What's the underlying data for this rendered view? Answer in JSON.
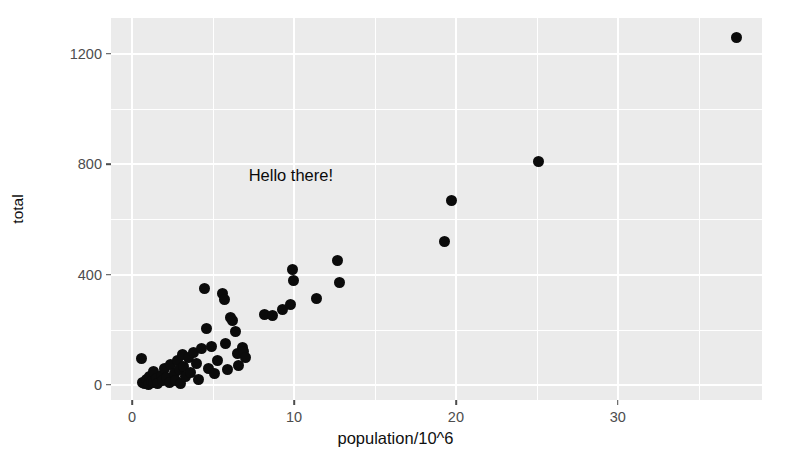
{
  "chart_data": {
    "type": "scatter",
    "title": "",
    "xlabel": "population/10^6",
    "ylabel": "total",
    "xlim": [
      -1.3,
      38.9
    ],
    "ylim": [
      -55,
      1330
    ],
    "x_ticks": [
      0,
      10,
      20,
      30
    ],
    "y_ticks": [
      0,
      400,
      800,
      1200
    ],
    "x_minor_ticks": [
      5,
      15,
      25,
      35
    ],
    "y_minor_ticks": [
      200,
      600,
      1000
    ],
    "grid": true,
    "legend": "none",
    "point_color": "#0b0b0b",
    "panel_background": "#ebebeb",
    "grid_color": "#ffffff",
    "annotations": [
      {
        "text": "Hello there!",
        "x": 7.2,
        "y": 790
      }
    ],
    "series": [
      {
        "name": "states",
        "points": [
          {
            "x": 0.6,
            "y": 95
          },
          {
            "x": 0.65,
            "y": 10
          },
          {
            "x": 0.75,
            "y": 5
          },
          {
            "x": 0.9,
            "y": 18
          },
          {
            "x": 1.0,
            "y": 2
          },
          {
            "x": 1.1,
            "y": 30
          },
          {
            "x": 1.2,
            "y": 12
          },
          {
            "x": 1.3,
            "y": 48
          },
          {
            "x": 1.35,
            "y": 8
          },
          {
            "x": 1.5,
            "y": 22
          },
          {
            "x": 1.6,
            "y": 6
          },
          {
            "x": 1.8,
            "y": 35
          },
          {
            "x": 1.9,
            "y": 14
          },
          {
            "x": 2.0,
            "y": 60
          },
          {
            "x": 2.1,
            "y": 25
          },
          {
            "x": 2.3,
            "y": 8
          },
          {
            "x": 2.4,
            "y": 72
          },
          {
            "x": 2.6,
            "y": 40
          },
          {
            "x": 2.7,
            "y": 16
          },
          {
            "x": 2.8,
            "y": 88
          },
          {
            "x": 2.9,
            "y": 55
          },
          {
            "x": 3.0,
            "y": 5
          },
          {
            "x": 3.1,
            "y": 110
          },
          {
            "x": 3.2,
            "y": 65
          },
          {
            "x": 3.3,
            "y": 30
          },
          {
            "x": 3.5,
            "y": 100
          },
          {
            "x": 3.6,
            "y": 45
          },
          {
            "x": 3.8,
            "y": 118
          },
          {
            "x": 4.0,
            "y": 78
          },
          {
            "x": 4.1,
            "y": 20
          },
          {
            "x": 4.3,
            "y": 130
          },
          {
            "x": 4.5,
            "y": 350
          },
          {
            "x": 4.6,
            "y": 205
          },
          {
            "x": 4.7,
            "y": 60
          },
          {
            "x": 4.9,
            "y": 140
          },
          {
            "x": 5.1,
            "y": 42
          },
          {
            "x": 5.3,
            "y": 90
          },
          {
            "x": 5.6,
            "y": 330
          },
          {
            "x": 5.7,
            "y": 310
          },
          {
            "x": 5.8,
            "y": 150
          },
          {
            "x": 5.9,
            "y": 55
          },
          {
            "x": 6.1,
            "y": 245
          },
          {
            "x": 6.2,
            "y": 232
          },
          {
            "x": 6.4,
            "y": 195
          },
          {
            "x": 6.5,
            "y": 112
          },
          {
            "x": 6.6,
            "y": 70
          },
          {
            "x": 6.8,
            "y": 135
          },
          {
            "x": 6.9,
            "y": 120
          },
          {
            "x": 7.0,
            "y": 100
          },
          {
            "x": 8.2,
            "y": 255
          },
          {
            "x": 8.7,
            "y": 250
          },
          {
            "x": 9.3,
            "y": 272
          },
          {
            "x": 9.8,
            "y": 290
          },
          {
            "x": 9.9,
            "y": 418
          },
          {
            "x": 10.0,
            "y": 378
          },
          {
            "x": 11.4,
            "y": 312
          },
          {
            "x": 12.7,
            "y": 452
          },
          {
            "x": 12.8,
            "y": 370
          },
          {
            "x": 19.3,
            "y": 518
          },
          {
            "x": 19.7,
            "y": 668
          },
          {
            "x": 25.1,
            "y": 808
          },
          {
            "x": 37.3,
            "y": 1258
          }
        ]
      }
    ]
  }
}
